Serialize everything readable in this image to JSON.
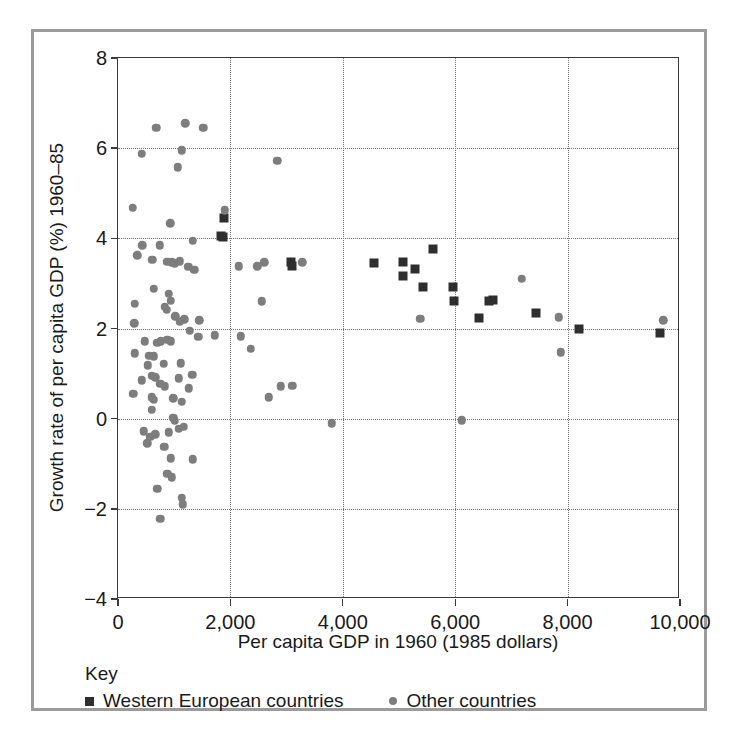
{
  "figure": {
    "frame_color": "#9b9b9b",
    "background": "#ffffff"
  },
  "legend": {
    "title": "Key",
    "entries": [
      {
        "marker": "square-marker",
        "label": "Western European countries",
        "color": "#2e2e2e"
      },
      {
        "marker": "circle-marker",
        "label": "Other countries",
        "color": "#7d7d7d"
      }
    ]
  },
  "chart_data": {
    "type": "scatter",
    "title": "",
    "xlabel": "Per capita GDP in 1960 (1985 dollars)",
    "ylabel": "Growth rate of per capita GDP (%) 1960–85",
    "xlim": [
      0,
      10000
    ],
    "ylim": [
      -4,
      8
    ],
    "xticks": [
      0,
      2000,
      4000,
      6000,
      8000,
      10000
    ],
    "xtick_labels": [
      "0",
      "2,000",
      "4,000",
      "6,000",
      "8,000",
      "10,000"
    ],
    "yticks": [
      -4,
      -2,
      0,
      2,
      4,
      6,
      8
    ],
    "ytick_labels": [
      "−4",
      "−2",
      "0",
      "2",
      "4",
      "6",
      "8"
    ],
    "grid": true,
    "grid_style": "dotted",
    "legend_position": "below-axes",
    "series": [
      {
        "name": "Western European countries",
        "marker": "square",
        "color": "#2e2e2e",
        "points": [
          [
            1880,
            4.45
          ],
          [
            1830,
            4.05
          ],
          [
            1870,
            4.02
          ],
          [
            3080,
            3.48
          ],
          [
            3090,
            3.38
          ],
          [
            4560,
            3.45
          ],
          [
            5080,
            3.47
          ],
          [
            5080,
            3.17
          ],
          [
            5290,
            3.32
          ],
          [
            5600,
            3.77
          ],
          [
            5430,
            2.92
          ],
          [
            5960,
            2.92
          ],
          [
            5980,
            2.62
          ],
          [
            6420,
            2.23
          ],
          [
            6600,
            2.6
          ],
          [
            6680,
            2.63
          ],
          [
            7430,
            2.35
          ],
          [
            8200,
            2.0
          ],
          [
            9640,
            1.9
          ]
        ]
      },
      {
        "name": "Other countries",
        "marker": "circle",
        "color": "#7d7d7d",
        "points": [
          [
            680,
            6.45
          ],
          [
            1200,
            6.55
          ],
          [
            1520,
            6.45
          ],
          [
            420,
            5.88
          ],
          [
            1130,
            5.95
          ],
          [
            1060,
            5.58
          ],
          [
            2830,
            5.72
          ],
          [
            260,
            4.68
          ],
          [
            1900,
            4.62
          ],
          [
            930,
            4.33
          ],
          [
            1330,
            3.95
          ],
          [
            430,
            3.85
          ],
          [
            740,
            3.85
          ],
          [
            340,
            3.62
          ],
          [
            610,
            3.52
          ],
          [
            880,
            3.48
          ],
          [
            960,
            3.47
          ],
          [
            1010,
            3.45
          ],
          [
            1100,
            3.49
          ],
          [
            1250,
            3.37
          ],
          [
            1360,
            3.3
          ],
          [
            2150,
            3.38
          ],
          [
            2600,
            3.47
          ],
          [
            640,
            2.88
          ],
          [
            900,
            2.77
          ],
          [
            940,
            2.62
          ],
          [
            300,
            2.55
          ],
          [
            830,
            2.48
          ],
          [
            870,
            2.42
          ],
          [
            1020,
            2.27
          ],
          [
            1180,
            2.2
          ],
          [
            290,
            2.12
          ],
          [
            1280,
            1.95
          ],
          [
            1430,
            1.82
          ],
          [
            1720,
            1.85
          ],
          [
            2180,
            1.83
          ],
          [
            480,
            1.72
          ],
          [
            700,
            1.68
          ],
          [
            760,
            1.72
          ],
          [
            880,
            1.75
          ],
          [
            940,
            1.72
          ],
          [
            2360,
            1.55
          ],
          [
            7880,
            1.47
          ],
          [
            300,
            1.45
          ],
          [
            560,
            1.4
          ],
          [
            640,
            1.38
          ],
          [
            810,
            1.22
          ],
          [
            1120,
            1.23
          ],
          [
            530,
            1.18
          ],
          [
            600,
            0.95
          ],
          [
            660,
            0.92
          ],
          [
            1080,
            0.9
          ],
          [
            1320,
            0.97
          ],
          [
            420,
            0.85
          ],
          [
            750,
            0.78
          ],
          [
            830,
            0.72
          ],
          [
            1260,
            0.68
          ],
          [
            2900,
            0.72
          ],
          [
            3100,
            0.73
          ],
          [
            270,
            0.55
          ],
          [
            600,
            0.48
          ],
          [
            640,
            0.42
          ],
          [
            980,
            0.45
          ],
          [
            1130,
            0.37
          ],
          [
            2680,
            0.47
          ],
          [
            600,
            0.2
          ],
          [
            980,
            0.02
          ],
          [
            1010,
            -0.05
          ],
          [
            6120,
            -0.03
          ],
          [
            3800,
            -0.1
          ],
          [
            460,
            -0.28
          ],
          [
            570,
            -0.4
          ],
          [
            660,
            -0.35
          ],
          [
            900,
            -0.3
          ],
          [
            1080,
            -0.22
          ],
          [
            1170,
            -0.18
          ],
          [
            520,
            -0.55
          ],
          [
            820,
            -0.62
          ],
          [
            940,
            -0.88
          ],
          [
            1330,
            -0.9
          ],
          [
            880,
            -1.22
          ],
          [
            960,
            -1.3
          ],
          [
            700,
            -1.55
          ],
          [
            1130,
            -1.75
          ],
          [
            1150,
            -1.9
          ],
          [
            750,
            -2.22
          ],
          [
            5380,
            2.22
          ],
          [
            7180,
            3.1
          ],
          [
            2560,
            2.6
          ],
          [
            2480,
            3.38
          ],
          [
            7840,
            2.25
          ],
          [
            9700,
            2.18
          ],
          [
            3280,
            3.47
          ],
          [
            1450,
            2.18
          ],
          [
            1100,
            2.15
          ]
        ]
      }
    ]
  }
}
